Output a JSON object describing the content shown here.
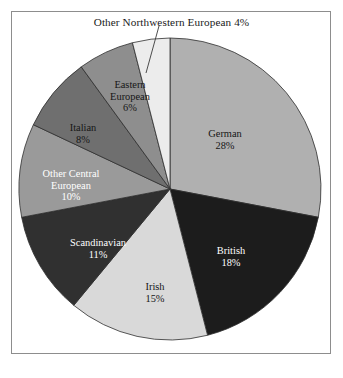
{
  "page": {
    "background_color": "#ffffff",
    "frame_border_color": "#8d8d8d"
  },
  "callout": {
    "text": "Other Northwestern European 4%",
    "leader_line_color": "#3a3a3a"
  },
  "chart_data": {
    "type": "pie",
    "title": "",
    "annotations": [
      "Other Northwestern European 4%"
    ],
    "legend_position": "none",
    "labels_inside_slices": true,
    "start_angle_deg": 0,
    "direction": "clockwise",
    "categories": [
      "German",
      "British",
      "Irish",
      "Scandinavian",
      "Other Central European",
      "Italian",
      "Eastern European",
      "Other Northwestern European"
    ],
    "values": [
      28,
      18,
      15,
      11,
      10,
      8,
      6,
      4
    ],
    "value_unit": "%",
    "colors": [
      "#b0b0b0",
      "#1c1c1c",
      "#d9d9d9",
      "#303030",
      "#9a9a9a",
      "#6f6f6f",
      "#8e8e8e",
      "#ececec"
    ],
    "slices": [
      {
        "name": "German",
        "value": 28,
        "value_text": "28%",
        "color": "#b0b0b0",
        "label_color": "dark",
        "label_shown_inside": true
      },
      {
        "name": "British",
        "value": 18,
        "value_text": "18%",
        "color": "#1c1c1c",
        "label_color": "light",
        "label_shown_inside": true
      },
      {
        "name": "Irish",
        "value": 15,
        "value_text": "15%",
        "color": "#d9d9d9",
        "label_color": "dark",
        "label_shown_inside": true
      },
      {
        "name": "Scandinavian",
        "value": 11,
        "value_text": "11%",
        "color": "#303030",
        "label_color": "light",
        "label_shown_inside": true
      },
      {
        "name": "Other Central European",
        "value": 10,
        "value_text": "10%",
        "color": "#9a9a9a",
        "label_color": "light",
        "label_shown_inside": true
      },
      {
        "name": "Italian",
        "value": 8,
        "value_text": "8%",
        "color": "#6f6f6f",
        "label_color": "dark",
        "label_shown_inside": true
      },
      {
        "name": "Eastern European",
        "value": 6,
        "value_text": "6%",
        "color": "#8e8e8e",
        "label_color": "dark",
        "label_shown_inside": true
      },
      {
        "name": "Other Northwestern European",
        "value": 4,
        "value_text": "4%",
        "color": "#ececec",
        "label_color": "dark",
        "label_shown_inside": false
      }
    ]
  },
  "labels": {
    "german": {
      "name": "German",
      "pct": "28%"
    },
    "british": {
      "name": "British",
      "pct": "18%"
    },
    "irish": {
      "name": "Irish",
      "pct": "15%"
    },
    "scandinavian": {
      "name": "Scandinavian",
      "pct": "11%"
    },
    "other_central_line1": "Other Central",
    "other_central_line2": "European",
    "other_central_pct": "10%",
    "italian": {
      "name": "Italian",
      "pct": "8%"
    },
    "eastern_line1": "Eastern",
    "eastern_line2": "European",
    "eastern_pct": "6%"
  }
}
